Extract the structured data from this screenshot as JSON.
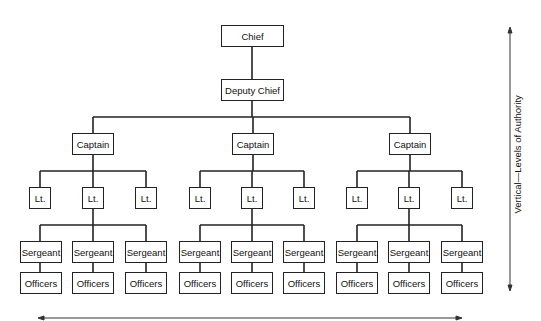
{
  "org_chart": {
    "top": {
      "label": "Chief"
    },
    "deputy": {
      "label": "Deputy Chief"
    },
    "captains": [
      {
        "label": "Captain",
        "lieutenants": [
          {
            "label": "Lt."
          },
          {
            "label": "Lt.",
            "sergeants": [
              {
                "label": "Sergeant",
                "officers": "Officers"
              },
              {
                "label": "Sergeant",
                "officers": "Officers"
              },
              {
                "label": "Sergeant",
                "officers": "Officers"
              }
            ]
          },
          {
            "label": "Lt."
          }
        ]
      },
      {
        "label": "Captain",
        "lieutenants": [
          {
            "label": "Lt."
          },
          {
            "label": "Lt.",
            "sergeants": [
              {
                "label": "Sergeant",
                "officers": "Officers"
              },
              {
                "label": "Sergeant",
                "officers": "Officers"
              },
              {
                "label": "Sergeant",
                "officers": "Officers"
              }
            ]
          },
          {
            "label": "Lt."
          }
        ]
      },
      {
        "label": "Captain",
        "lieutenants": [
          {
            "label": "Lt."
          },
          {
            "label": "Lt.",
            "sergeants": [
              {
                "label": "Sergeant",
                "officers": "Officers"
              },
              {
                "label": "Sergeant",
                "officers": "Officers"
              },
              {
                "label": "Sergeant",
                "officers": "Officers"
              }
            ]
          },
          {
            "label": "Lt."
          }
        ]
      }
    ]
  },
  "axes": {
    "vertical_label": "Vertical—Levels of Authority",
    "horizontal_label": ""
  },
  "colors": {
    "line": "#222222",
    "background": "#ffffff"
  }
}
